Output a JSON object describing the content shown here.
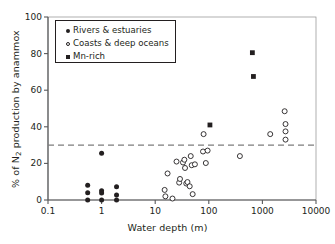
{
  "chart_data": {
    "type": "scatter",
    "title": "",
    "xlabel": "Water depth (m)",
    "ylabel": "% of N2 production by anammox",
    "ylabel_parts": {
      "pre": "% of N",
      "sub": "2",
      "post": " production by anammox"
    },
    "xscale": "log",
    "xlim": [
      0.1,
      10000
    ],
    "ylim": [
      0,
      100
    ],
    "xticks": [
      0.1,
      1,
      10,
      100,
      1000,
      10000
    ],
    "xtick_labels": [
      "0.1",
      "1",
      "10",
      "100",
      "1000",
      "10000"
    ],
    "yticks": [
      0,
      20,
      40,
      60,
      80,
      100
    ],
    "ytick_labels": [
      "0",
      "20",
      "40",
      "60",
      "80",
      "100"
    ],
    "grid": false,
    "legend_position": "upper-left",
    "threshold_line": {
      "value": 30,
      "style": "dashed",
      "color": "#7d7d7d",
      "orientation": "horizontal"
    },
    "series": [
      {
        "name": "Rivers & estuaries",
        "marker": "filled-circle",
        "color": "#231f20",
        "points": [
          {
            "x": 0.55,
            "y": 8.0
          },
          {
            "x": 0.55,
            "y": 4.0
          },
          {
            "x": 0.55,
            "y": 0.0
          },
          {
            "x": 1.0,
            "y": 25.5
          },
          {
            "x": 1.0,
            "y": 5.0
          },
          {
            "x": 1.0,
            "y": 3.8
          },
          {
            "x": 1.0,
            "y": 0.0
          },
          {
            "x": 1.9,
            "y": 7.3
          },
          {
            "x": 1.9,
            "y": 2.8
          },
          {
            "x": 1.9,
            "y": 0.0
          }
        ]
      },
      {
        "name": "Coasts & deep oceans",
        "marker": "open-circle",
        "color": "#231f20",
        "points": [
          {
            "x": 15.0,
            "y": 5.5
          },
          {
            "x": 15.5,
            "y": 2.0
          },
          {
            "x": 17.0,
            "y": 14.5
          },
          {
            "x": 21.0,
            "y": 0.8
          },
          {
            "x": 25.0,
            "y": 21.0
          },
          {
            "x": 28.0,
            "y": 9.5
          },
          {
            "x": 29.0,
            "y": 11.5
          },
          {
            "x": 33.0,
            "y": 20.5
          },
          {
            "x": 35.0,
            "y": 22.0
          },
          {
            "x": 36.0,
            "y": 17.5
          },
          {
            "x": 38.0,
            "y": 9.0
          },
          {
            "x": 40.0,
            "y": 9.8
          },
          {
            "x": 44.0,
            "y": 7.5
          },
          {
            "x": 46.0,
            "y": 24.0
          },
          {
            "x": 48.0,
            "y": 19.0
          },
          {
            "x": 50.0,
            "y": 3.2
          },
          {
            "x": 55.0,
            "y": 19.5
          },
          {
            "x": 78.0,
            "y": 26.5
          },
          {
            "x": 80.0,
            "y": 36.0
          },
          {
            "x": 88.0,
            "y": 20.2
          },
          {
            "x": 95.0,
            "y": 27.0
          },
          {
            "x": 380.0,
            "y": 24.0
          },
          {
            "x": 1400.0,
            "y": 36.0
          },
          {
            "x": 2600.0,
            "y": 48.5
          },
          {
            "x": 2700.0,
            "y": 41.5
          },
          {
            "x": 2700.0,
            "y": 37.5
          },
          {
            "x": 2700.0,
            "y": 33.0
          }
        ]
      },
      {
        "name": "Mn-rich",
        "marker": "filled-square",
        "color": "#231f20",
        "points": [
          {
            "x": 105.0,
            "y": 41.0
          },
          {
            "x": 650.0,
            "y": 80.5
          },
          {
            "x": 680.0,
            "y": 67.5
          }
        ]
      }
    ]
  },
  "legend": {
    "items": [
      {
        "label": "Rivers & estuaries",
        "marker": "filled-circle"
      },
      {
        "label": "Coasts & deep oceans",
        "marker": "open-circle"
      },
      {
        "label": "Mn-rich",
        "marker": "filled-square"
      }
    ]
  }
}
